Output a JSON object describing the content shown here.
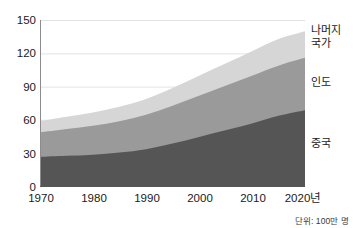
{
  "chart_data": {
    "type": "area",
    "stacked": true,
    "title": "",
    "subtitle": "",
    "xlabel": "",
    "ylabel": "",
    "unit_note": "단위: 100만 명",
    "x": [
      1970,
      1975,
      1980,
      1985,
      1990,
      1995,
      2000,
      2005,
      2010,
      2015,
      2020
    ],
    "xlim": [
      1970,
      2020
    ],
    "ylim": [
      0,
      150
    ],
    "x_tick_labels": [
      "1970",
      "1980",
      "1990",
      "2000",
      "2010",
      "2020년"
    ],
    "x_ticks": [
      1970,
      1980,
      1990,
      2000,
      2010,
      2020
    ],
    "y_ticks": [
      0,
      30,
      60,
      90,
      120,
      150
    ],
    "y_tick_labels": [
      "0",
      "30",
      "60",
      "90",
      "120",
      "150"
    ],
    "grid": "horizontal",
    "legend_position": "right-inline",
    "series": [
      {
        "name": "중국",
        "color": "#555555",
        "values": [
          27,
          28,
          29,
          31,
          34,
          39,
          45,
          51,
          57,
          64,
          69
        ]
      },
      {
        "name": "인도",
        "color": "#9a9a9a",
        "values": [
          22,
          24,
          26,
          28,
          31,
          34,
          37,
          40,
          43,
          45,
          47
        ]
      },
      {
        "name": "나머지 국가",
        "color": "#d6d6d6",
        "values": [
          10,
          11,
          12,
          13,
          14,
          16,
          18,
          20,
          22,
          24,
          24
        ]
      }
    ],
    "stack_tops": {
      "중국": [
        27,
        28,
        29,
        31,
        34,
        39,
        45,
        51,
        57,
        64,
        69
      ],
      "인도": [
        49,
        52,
        55,
        59,
        65,
        73,
        82,
        91,
        100,
        109,
        116
      ],
      "나머지 국가": [
        59,
        63,
        67,
        72,
        79,
        89,
        100,
        111,
        122,
        133,
        140
      ]
    }
  },
  "axes": {
    "y_labels": [
      "150",
      "120",
      "90",
      "60",
      "30",
      "0"
    ],
    "x_labels": [
      "1970",
      "1980",
      "1990",
      "2000",
      "2010",
      "2020년"
    ]
  },
  "legend": {
    "rest_of_world": "나머지\n국가",
    "india": "인도",
    "china": "중국"
  },
  "footnote": {
    "text": "단위: 100만 명"
  }
}
